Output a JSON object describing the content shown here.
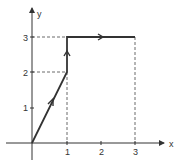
{
  "diagram": {
    "type": "path-on-axes",
    "axes": {
      "x_label": "x",
      "y_label": "y",
      "x_ticks": [
        "1",
        "2",
        "3"
      ],
      "y_ticks": [
        "1",
        "2",
        "3"
      ]
    },
    "path_points": [
      [
        0,
        0
      ],
      [
        1,
        2
      ],
      [
        1,
        3
      ],
      [
        3,
        3
      ]
    ],
    "guide_lines": [
      {
        "from": [
          0,
          3
        ],
        "to": [
          1,
          3
        ]
      },
      {
        "from": [
          0,
          2
        ],
        "to": [
          1,
          2
        ]
      },
      {
        "from": [
          1,
          0
        ],
        "to": [
          1,
          2
        ]
      },
      {
        "from": [
          3,
          0
        ],
        "to": [
          3,
          3
        ]
      }
    ],
    "colors": {
      "axis": "#333333",
      "path": "#333333",
      "guide": "#444444"
    }
  }
}
